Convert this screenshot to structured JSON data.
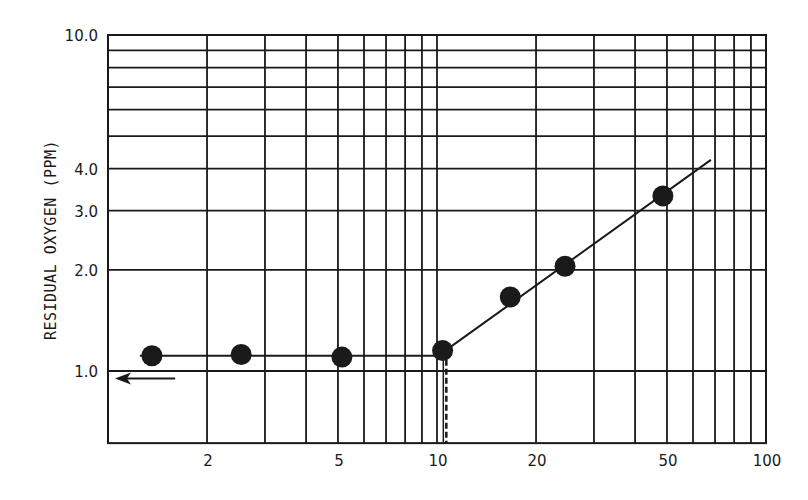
{
  "chart_data": {
    "type": "scatter",
    "title": "",
    "xlabel": "",
    "ylabel": "RESIDUAL OXYGEN (PPM)",
    "xscale": "log",
    "yscale": "log",
    "xlim": [
      1,
      100
    ],
    "ylim": [
      0.61,
      10.0
    ],
    "grid": true,
    "legend": null,
    "x_tick_labels": [
      "2",
      "5",
      "10",
      "20",
      "50",
      "100"
    ],
    "x_tick_values": [
      2,
      5,
      10,
      20,
      50,
      100
    ],
    "x_grid_values": [
      2,
      3,
      4,
      5,
      6,
      7,
      8,
      9,
      10,
      20,
      30,
      40,
      50,
      60,
      70,
      80,
      90,
      100
    ],
    "y_tick_labels": [
      "1.0",
      "2.0",
      "3.0",
      "4.0",
      "10.0"
    ],
    "y_tick_values": [
      1.0,
      2.0,
      3.0,
      4.0,
      10.0
    ],
    "y_grid_values": [
      1,
      2,
      3,
      4,
      5,
      6,
      7,
      8,
      9,
      10
    ],
    "series": [
      {
        "name": "measured points",
        "marker": "filled-circle",
        "x": [
          1.36,
          2.54,
          5.14,
          10.4,
          16.7,
          24.5,
          48.6
        ],
        "y": [
          1.11,
          1.12,
          1.1,
          1.15,
          1.66,
          2.05,
          3.32
        ]
      },
      {
        "name": "fit line (plateau)",
        "style": "solid",
        "x": [
          1.25,
          10.6
        ],
        "y": [
          1.11,
          1.11
        ]
      },
      {
        "name": "fit line (rising)",
        "style": "solid",
        "x": [
          10.6,
          68
        ],
        "y": [
          1.15,
          4.25
        ]
      }
    ],
    "annotations": [
      {
        "type": "dashed-vertical-line",
        "x": 10.6,
        "y_from": 1.11,
        "y_to": 0.61,
        "meaning": "breakpoint"
      },
      {
        "type": "arrow-left",
        "x_from": 1.6,
        "x_to": 1.05,
        "y": 0.95,
        "meaning": "points toward y-axis (1.0 baseline)"
      }
    ]
  },
  "colors": {
    "ink": "#1a1a1a",
    "background": "#ffffff"
  }
}
